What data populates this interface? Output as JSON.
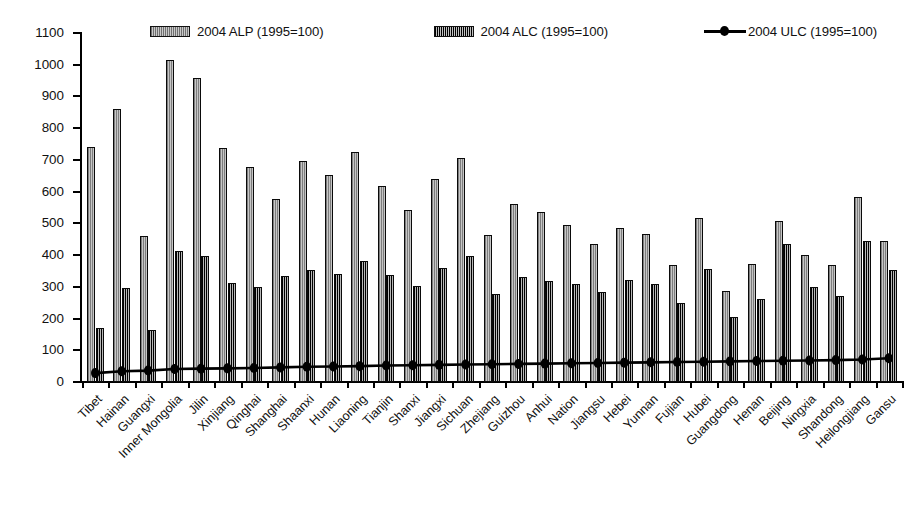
{
  "chart_data": {
    "type": "bar",
    "title": "",
    "xlabel": "",
    "ylabel": "",
    "ylim": [
      0,
      1100
    ],
    "ytick_step": 100,
    "grid": false,
    "legend_position": "top",
    "yticks": [
      0,
      100,
      200,
      300,
      400,
      500,
      600,
      700,
      800,
      900,
      1000,
      1100
    ],
    "categories": [
      "Tibet",
      "Hainan",
      "Guangxi",
      "Inner Mongolia",
      "Jilin",
      "Xinjiang",
      "Qinghai",
      "Shanghai",
      "Shaanxi",
      "Hunan",
      "Liaoning",
      "Tianjin",
      "Shanxi",
      "Jiangxi",
      "Sichuan",
      "Zhejiang",
      "Guizhou",
      "Anhui",
      "Nation",
      "Jiangsu",
      "Hebei",
      "Yunnan",
      "Fujian",
      "Hubei",
      "Guangdong",
      "Henan",
      "Beijing",
      "Ningxia",
      "Shandong",
      "Heilongjiang",
      "Gansu"
    ],
    "series": [
      {
        "name": "2004 ALP (1995=100)",
        "kind": "bar",
        "color": "#b0b0b0",
        "values": [
          740,
          862,
          460,
          1015,
          958,
          738,
          678,
          578,
          698,
          652,
          725,
          617,
          543,
          641,
          706,
          463,
          560,
          535,
          494,
          434,
          485,
          466,
          370,
          516,
          288,
          372,
          508,
          400,
          368,
          583,
          443
        ]
      },
      {
        "name": "2004 ALC (1995=100)",
        "kind": "bar",
        "color": "#262626",
        "values": [
          170,
          295,
          163,
          413,
          398,
          312,
          300,
          335,
          352,
          340,
          380,
          337,
          303,
          360,
          398,
          277,
          330,
          318,
          310,
          283,
          320,
          310,
          250,
          355,
          205,
          263,
          435,
          300,
          270,
          443,
          352
        ]
      },
      {
        "name": "2004 ULC (1995=100)",
        "kind": "line",
        "color": "#000000",
        "marker": "filled-circle",
        "values": [
          28,
          34,
          36,
          41,
          42,
          43,
          44,
          46,
          48,
          49,
          50,
          52,
          53,
          54,
          55,
          56,
          57,
          58,
          59,
          60,
          61,
          62,
          63,
          64,
          65,
          66,
          67,
          68,
          69,
          71,
          75
        ]
      }
    ]
  },
  "legend": {
    "entries": [
      {
        "label": "2004 ALP (1995=100)",
        "swatch": "alp-swatch"
      },
      {
        "label": "2004 ALC (1995=100)",
        "swatch": "alc-swatch"
      },
      {
        "label": "2004 ULC (1995=100)",
        "swatch": "ulc-line-marker"
      }
    ]
  }
}
